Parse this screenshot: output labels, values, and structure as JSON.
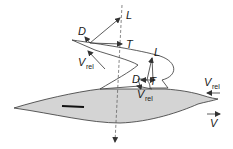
{
  "diagram": {
    "colors": {
      "body_fill": "#d4d4d4",
      "stroke": "#333333",
      "background": "#ffffff"
    },
    "labels": {
      "upper": {
        "lift": "L",
        "drag": "D",
        "thrust": "T",
        "vrel_main": "V",
        "vrel_sub": "rel"
      },
      "lower": {
        "lift": "L",
        "drag": "D",
        "thrust": "T",
        "vrel_main": "V",
        "vrel_sub": "rel"
      },
      "incoming": {
        "vrel_main": "V",
        "vrel_sub": "rel"
      },
      "velocity": "V"
    }
  }
}
